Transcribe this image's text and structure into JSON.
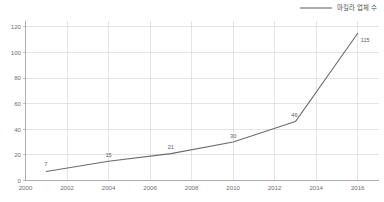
{
  "chart_data": {
    "type": "line",
    "title": "",
    "subtitle": "",
    "xlabel": "",
    "ylabel": "",
    "legend_position": "top-right",
    "grid": true,
    "xlim": [
      2000,
      2017
    ],
    "ylim": [
      0,
      125
    ],
    "x_ticks": [
      "2000",
      "2002",
      "2004",
      "2006",
      "2008",
      "2010",
      "2012",
      "2014",
      "2016"
    ],
    "x_tick_values": [
      2000,
      2002,
      2004,
      2006,
      2008,
      2010,
      2012,
      2014,
      2016
    ],
    "y_ticks": [
      "0",
      "20",
      "40",
      "60",
      "80",
      "100",
      "120"
    ],
    "y_tick_values": [
      0,
      20,
      40,
      60,
      80,
      100,
      120
    ],
    "series": [
      {
        "name": "마킬라 업체 수",
        "color": "#6b6b6d",
        "x": [
          2001,
          2004,
          2007,
          2010,
          2013,
          2016
        ],
        "values": [
          7,
          15,
          21,
          30,
          46,
          115
        ],
        "point_labels": [
          "7",
          "15",
          "21",
          "30",
          "46",
          "115"
        ]
      }
    ]
  },
  "legend": {
    "entries": [
      {
        "label": "마킬라 업체 수",
        "color": "#6b6b6d"
      }
    ]
  },
  "colors": {
    "series": "#6b6b6d",
    "grid": "#d2d2d4",
    "axis": "#9a9a9c",
    "text": "#58585a",
    "background": "#ffffff"
  }
}
